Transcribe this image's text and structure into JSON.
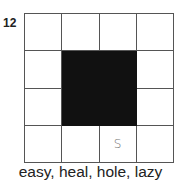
{
  "puzzle": {
    "number": "12",
    "grid": {
      "rows": 4,
      "cols": 4,
      "cells": [
        [
          "",
          "",
          "",
          ""
        ],
        [
          "",
          "#",
          "#",
          ""
        ],
        [
          "",
          "#",
          "#",
          ""
        ],
        [
          "",
          "",
          "S",
          ""
        ]
      ]
    },
    "clue_words": "easy, heal, hole, lazy"
  }
}
